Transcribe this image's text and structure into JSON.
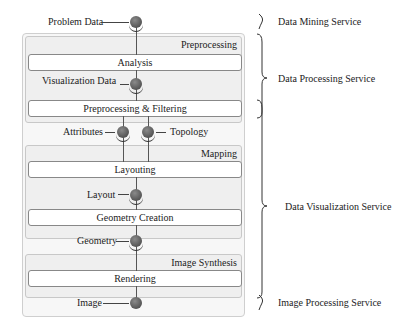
{
  "diagram": {
    "type": "visualization-pipeline",
    "data_nodes": [
      {
        "id": "problem_data",
        "label": "Problem Data"
      },
      {
        "id": "visualization_data",
        "label": "Visualization Data"
      },
      {
        "id": "attributes",
        "label": "Attributes"
      },
      {
        "id": "topology",
        "label": "Topology"
      },
      {
        "id": "layout",
        "label": "Layout"
      },
      {
        "id": "geometry",
        "label": "Geometry"
      },
      {
        "id": "image",
        "label": "Image"
      }
    ],
    "groups": [
      {
        "id": "preprocessing",
        "label": "Preprocessing",
        "processes": [
          "Analysis",
          "Preprocessing & Filtering"
        ]
      },
      {
        "id": "mapping",
        "label": "Mapping",
        "processes": [
          "Layouting",
          "Geometry Creation"
        ]
      },
      {
        "id": "image_synthesis",
        "label": "Image Synthesis",
        "processes": [
          "Rendering"
        ]
      }
    ],
    "services": [
      {
        "label": "Data Mining Service"
      },
      {
        "label": "Data Processing Service"
      },
      {
        "label": "Data Visualization Service"
      },
      {
        "label": "Image Processing Service"
      }
    ],
    "colors": {
      "node_fill": "#666666",
      "group_fill": "#efefef",
      "box_fill": "#ffffff",
      "border": "#888888"
    }
  }
}
